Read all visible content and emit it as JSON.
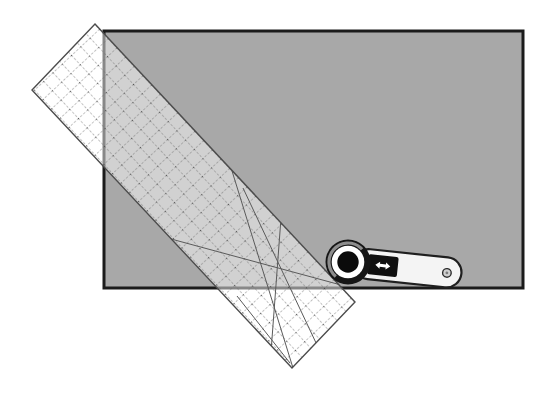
{
  "scene": {
    "name": "rotary-cutting-illustration",
    "items": [
      "fabric-panel",
      "acrylic-grid-ruler",
      "rotary-cutter"
    ]
  },
  "colors": {
    "background": "#ffffff",
    "fabric": "#a8a8a8",
    "fabric_border": "#1b1b1b",
    "ruler_tint": "#ffffff",
    "grid_line": "#6e6e6e",
    "grid_dot": "#3f3f3f",
    "ruler_outline": "#4c4c4c",
    "angle_line": "#5a5a5a",
    "cutter_dark": "#161616",
    "blade_center": "#0b0b0b",
    "blade_ring": "#ffffff",
    "blade_highlight": "#8d8d8d",
    "handle_fill": "#f4f4f4",
    "handle_stroke": "#1f1f1f",
    "slider_fill": "#101010",
    "arrow_fill": "#ffffff",
    "rivet_fill": "#cfcfcf",
    "rivet_stroke": "#2b2b2b"
  }
}
